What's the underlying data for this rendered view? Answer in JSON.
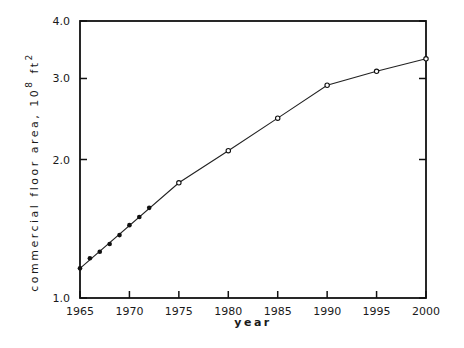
{
  "chart_data": {
    "type": "line",
    "title": "",
    "xlabel": "year",
    "ylabel": "commercial floor area, 10^8 ft^2",
    "ylabel_parts": {
      "main": "commercial floor area, 10",
      "exp1": "8",
      "unit": " ft",
      "exp2": "2"
    },
    "xlim": [
      1965,
      2000
    ],
    "ylim": [
      1.0,
      4.0
    ],
    "yscale": "log",
    "grid": false,
    "legend": null,
    "x_ticks": [
      1965,
      1970,
      1975,
      1980,
      1985,
      1990,
      1995,
      2000
    ],
    "x_tick_labels": [
      "1965",
      "1970",
      "1975",
      "1980",
      "1985",
      "1990",
      "1995",
      "2000"
    ],
    "y_ticks": [
      1.0,
      2.0,
      3.0,
      4.0
    ],
    "y_tick_labels": [
      "1.0",
      "2.0",
      "3.0",
      "4.0"
    ],
    "series": [
      {
        "name": "historical",
        "marker": "filled-circle",
        "x": [
          1965,
          1966,
          1967,
          1968,
          1969,
          1970,
          1971,
          1972
        ],
        "values": [
          1.16,
          1.22,
          1.26,
          1.31,
          1.37,
          1.44,
          1.5,
          1.57
        ]
      },
      {
        "name": "projected",
        "marker": "open-circle",
        "x": [
          1975,
          1980,
          1985,
          1990,
          1995,
          2000
        ],
        "values": [
          1.78,
          2.09,
          2.46,
          2.9,
          3.11,
          3.31
        ]
      }
    ]
  }
}
